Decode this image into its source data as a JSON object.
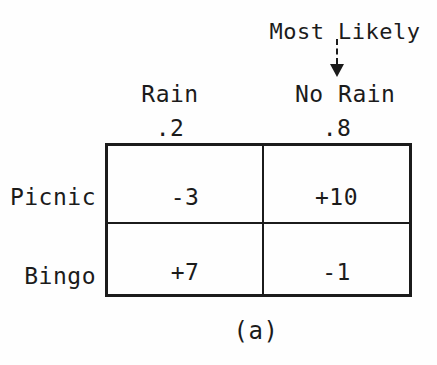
{
  "figure": {
    "annotation": {
      "label": "Most Likely",
      "arrow_icon": "dashed-down-arrow",
      "points_to": "No Rain"
    },
    "columns": [
      {
        "label": "Rain",
        "probability": ".2"
      },
      {
        "label": "No Rain",
        "probability": ".8"
      }
    ],
    "rows": [
      {
        "label": "Picnic",
        "values": {
          "0": "-3",
          "1": "+10"
        }
      },
      {
        "label": "Bingo",
        "values": {
          "0": "+7",
          "1": "-1"
        }
      }
    ],
    "caption": "(a)",
    "colors": {
      "ink": "#1b1b1b",
      "background": "#fefefe"
    }
  },
  "chart_data": {
    "type": "table",
    "columns": [
      "Rain",
      "No Rain"
    ],
    "column_probabilities": [
      0.2,
      0.8
    ],
    "rows": [
      "Picnic",
      "Bingo"
    ],
    "values": [
      [
        -3,
        10
      ],
      [
        7,
        -1
      ]
    ],
    "annotation": "Most Likely (dashed arrow above No Rain column)",
    "caption": "(a)"
  }
}
